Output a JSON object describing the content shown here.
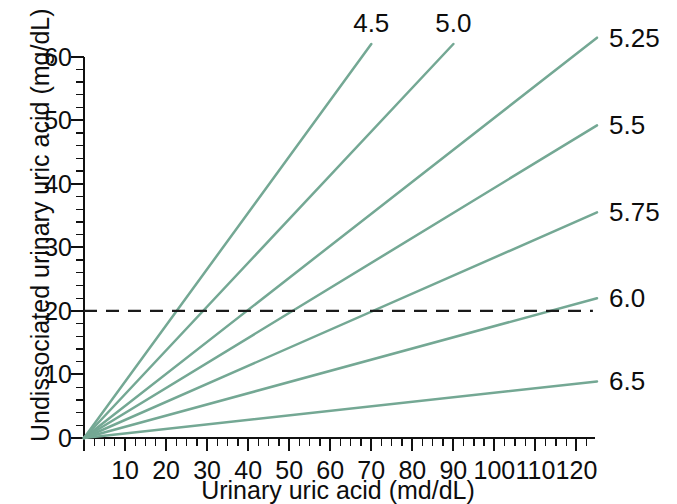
{
  "chart_data": {
    "type": "line",
    "title": "",
    "xlabel": "Urinary uric acid (md/dL)",
    "ylabel": "Undissociated urinary uric acid (mg/dL)",
    "xlim": [
      0,
      125
    ],
    "ylim": [
      0,
      62
    ],
    "grid": false,
    "legend_position": "line-end labels (top and right margins)",
    "x_ticks": [
      10,
      20,
      30,
      40,
      50,
      60,
      70,
      80,
      90,
      100,
      110,
      120
    ],
    "x_tick_labels": [
      "10",
      "20",
      "30",
      "40",
      "50",
      "60",
      "70",
      "80",
      "90",
      "100",
      "110",
      "120"
    ],
    "x_minor_tick_step": 2.5,
    "y_ticks": [
      0,
      10,
      20,
      30,
      40,
      50,
      60
    ],
    "y_tick_labels": [
      "0",
      "10",
      "20",
      "30",
      "40",
      "50",
      "60"
    ],
    "y_minor_tick_step": 2,
    "series": [
      {
        "name": "4.5",
        "label": "4.5",
        "label_position": "top",
        "slope": 0.885,
        "x": [
          0,
          70
        ],
        "values": [
          0,
          62.0
        ],
        "color": "#74a894"
      },
      {
        "name": "5.0",
        "label": "5.0",
        "label_position": "top",
        "slope": 0.689,
        "x": [
          0,
          90
        ],
        "values": [
          0,
          62.0
        ],
        "color": "#74a894"
      },
      {
        "name": "5.25",
        "label": "5.25",
        "label_position": "right",
        "slope": 0.504,
        "x": [
          0,
          125
        ],
        "values": [
          0,
          63.0
        ],
        "color": "#74a894"
      },
      {
        "name": "5.5",
        "label": "5.5",
        "label_position": "right",
        "slope": 0.394,
        "x": [
          0,
          125
        ],
        "values": [
          0,
          49.2
        ],
        "color": "#74a894"
      },
      {
        "name": "5.75",
        "label": "5.75",
        "label_position": "right",
        "slope": 0.284,
        "x": [
          0,
          125
        ],
        "values": [
          0,
          35.5
        ],
        "color": "#74a894"
      },
      {
        "name": "6.0",
        "label": "6.0",
        "label_position": "right",
        "slope": 0.176,
        "x": [
          0,
          125
        ],
        "values": [
          0,
          22.0
        ],
        "color": "#74a894"
      },
      {
        "name": "6.5",
        "label": "6.5",
        "label_position": "right",
        "slope": 0.0712,
        "x": [
          0,
          125
        ],
        "values": [
          0,
          8.9
        ],
        "color": "#74a894"
      }
    ],
    "annotations": [
      {
        "type": "hline",
        "name": "threshold-20",
        "y": 20,
        "x_start": 0,
        "x_end": 124,
        "style": "dashed",
        "color": "#1a1a1a",
        "label": ""
      }
    ]
  },
  "axes": {
    "y_title": "Undissociated urinary uric acid (mg/dL)",
    "x_title": "Urinary uric acid (md/dL)"
  },
  "y_tick_labels": [
    "60",
    "50",
    "40",
    "30",
    "20",
    "10",
    "0"
  ],
  "x_tick_labels": [
    "10",
    "20",
    "30",
    "40",
    "50",
    "60",
    "70",
    "80",
    "90",
    "100",
    "110",
    "120"
  ],
  "top_labels": [
    "4.5",
    "5.0"
  ],
  "right_labels": [
    "5.25",
    "5.5",
    "5.75",
    "6.0",
    "6.5"
  ]
}
